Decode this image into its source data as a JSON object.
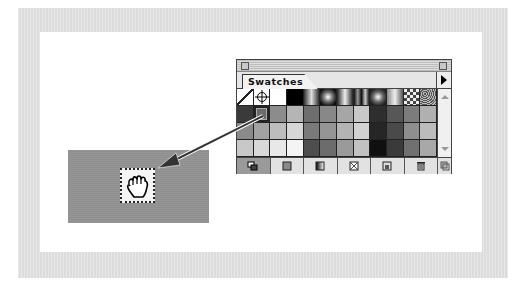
{
  "panel": {
    "tab_label": "Swatches",
    "menu_icon": "triangle-right-icon",
    "swatch_rows": [
      [
        "none",
        "registration",
        "#ffffff",
        "#000000",
        "grad-linear",
        "grad-radial",
        "grad-linear-2",
        "grad-linear-3",
        "grad-radial-2",
        "grad-linear-4",
        "pattern-check",
        "pattern-noise"
      ],
      [
        "#3a3a3a",
        "#6a6a6a",
        "#8c8c8c",
        "#b5b5b5",
        "#6e6e6e",
        "#888888",
        "#a6a6a6",
        "#c8c8c8",
        "#2e2e2e",
        "#575757",
        "#7c7c7c",
        "#b0b0b0"
      ],
      [
        "#8a8a8a",
        "#a2a2a2",
        "#bdbdbd",
        "#d6d6d6",
        "#7a7a7a",
        "#959595",
        "#b4b4b4",
        "#d2d2d2",
        "#262626",
        "#4a4a4a",
        "#8e8e8e",
        "#bcbcbc"
      ],
      [
        "#c8c8c8",
        "#d8d8d8",
        "#e8e8e8",
        "#f4f4f4",
        "#4e4e4e",
        "#6c6c6c",
        "#9a9a9a",
        "#c2c2c2",
        "#101010",
        "#3a3a3a",
        "#707070",
        "#a8a8a8"
      ]
    ],
    "selected_swatch": {
      "row": 1,
      "col": 1
    },
    "bottom_buttons": [
      {
        "name": "show-all-swatches",
        "icon": "all-swatches-icon"
      },
      {
        "name": "show-color-swatches",
        "icon": "color-swatch-icon"
      },
      {
        "name": "show-gradient-swatches",
        "icon": "gradient-swatch-icon"
      },
      {
        "name": "show-pattern-swatches",
        "icon": "pattern-swatch-icon"
      },
      {
        "name": "new-swatch",
        "icon": "new-swatch-icon"
      },
      {
        "name": "delete-swatch",
        "icon": "trash-icon"
      }
    ]
  },
  "canvas": {
    "object_fill": "#8f8f8f",
    "cursor": "grabbing-hand-icon"
  },
  "colors": {
    "frame": "#dcdcdc",
    "panel_bg": "#e6e6e6",
    "arrow": "#333333"
  }
}
